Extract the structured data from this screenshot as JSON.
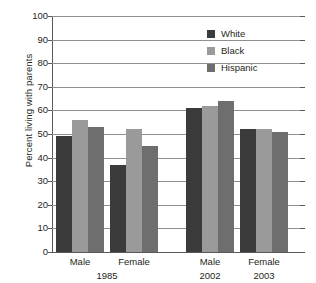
{
  "chart_data": {
    "type": "bar",
    "title": "",
    "xlabel": "",
    "ylabel": "Percent living with parents",
    "ylim": [
      0,
      100
    ],
    "ytick_labels": [
      "0",
      "10",
      "20",
      "30",
      "40",
      "50",
      "60",
      "70",
      "80",
      "90",
      "100"
    ],
    "ytick_values": [
      0,
      10,
      20,
      30,
      40,
      50,
      60,
      70,
      80,
      90,
      100
    ],
    "grid": true,
    "legend_position": "top-right",
    "categories": [
      "Male",
      "Female",
      "Male",
      "Female"
    ],
    "group_labels": [
      "1985",
      "2002",
      "2003"
    ],
    "groups": [
      {
        "period": "1985",
        "sex": "Male",
        "year_label": "1985"
      },
      {
        "period": "1985",
        "sex": "Female",
        "year_label": ""
      },
      {
        "period": "2002",
        "sex": "Male",
        "year_label": "2002"
      },
      {
        "period": "2003",
        "sex": "Female",
        "year_label": "2003"
      }
    ],
    "series": [
      {
        "name": "White",
        "color": "#3b3b3b",
        "values": [
          49,
          37,
          61,
          52
        ]
      },
      {
        "name": "Black",
        "color": "#9a9a9a",
        "values": [
          56,
          52,
          62,
          52
        ]
      },
      {
        "name": "Hispanic",
        "color": "#6e6e6e",
        "values": [
          53,
          45,
          64,
          51
        ]
      }
    ]
  },
  "legend": {
    "items": [
      {
        "label": "White",
        "swatch": "white"
      },
      {
        "label": "Black",
        "swatch": "black"
      },
      {
        "label": "Hispanic",
        "swatch": "hispanic"
      }
    ]
  },
  "axis": {
    "y_title": "Percent living with parents"
  }
}
